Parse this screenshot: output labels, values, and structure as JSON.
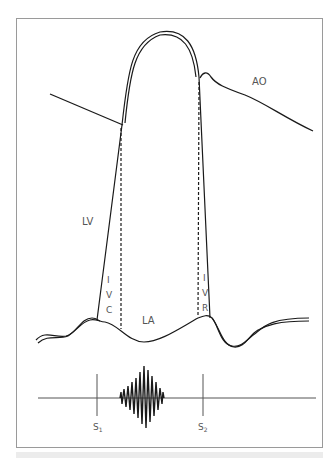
{
  "diagram": {
    "labels": {
      "aorta": "AO",
      "left_ventricle": "LV",
      "left_atrium": "LA",
      "ivc": [
        "I",
        "V",
        "C"
      ],
      "ivr": [
        "I",
        "V",
        "R"
      ],
      "s1": "S",
      "s1_sub": "1",
      "s2": "S",
      "s2_sub": "2"
    },
    "colors": {
      "line": "#1a1a1a",
      "frame": "#9a9a9a",
      "label": "#555555",
      "caption_bar": "#ececec"
    }
  }
}
